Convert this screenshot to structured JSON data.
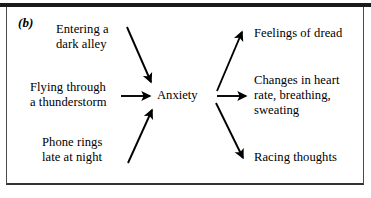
{
  "figure": {
    "panel_label": "(b)",
    "center_node": "Anxiety",
    "border_color": "#1a1a1a",
    "text_color": "#000000",
    "background_color": "#ffffff",
    "arrow_color": "#000000"
  },
  "stimuli": [
    {
      "id": "entering-dark-alley",
      "label": "Entering a\ndark alley"
    },
    {
      "id": "flying-thunderstorm",
      "label": "Flying through\na thunderstorm"
    },
    {
      "id": "phone-rings-late",
      "label": "Phone rings\nlate at night"
    }
  ],
  "responses": [
    {
      "id": "feelings-of-dread",
      "label": "Feelings of dread"
    },
    {
      "id": "physiological-changes",
      "label": "Changes in heart\nrate, breathing,\nsweating"
    },
    {
      "id": "racing-thoughts",
      "label": "Racing thoughts"
    }
  ],
  "arrows": [
    {
      "id": "arrow-stimulus-0-to-center",
      "from": "entering-dark-alley",
      "to": "Anxiety",
      "direction": "down-right",
      "x1": 127,
      "y1": 27,
      "x2": 152,
      "y2": 84
    },
    {
      "id": "arrow-stimulus-1-to-center",
      "from": "flying-thunderstorm",
      "to": "Anxiety",
      "direction": "right",
      "x1": 121,
      "y1": 96,
      "x2": 152,
      "y2": 96
    },
    {
      "id": "arrow-stimulus-2-to-center",
      "from": "phone-rings-late",
      "to": "Anxiety",
      "direction": "up-right",
      "x1": 128,
      "y1": 163,
      "x2": 152,
      "y2": 108
    },
    {
      "id": "arrow-center-to-response-0",
      "from": "Anxiety",
      "to": "feelings-of-dread",
      "direction": "up-right",
      "x1": 217,
      "y1": 91,
      "x2": 243,
      "y2": 30
    },
    {
      "id": "arrow-center-to-response-1",
      "from": "Anxiety",
      "to": "physiological-changes",
      "direction": "right",
      "x1": 217,
      "y1": 96,
      "x2": 248,
      "y2": 96
    },
    {
      "id": "arrow-center-to-response-2",
      "from": "Anxiety",
      "to": "racing-thoughts",
      "direction": "down-right",
      "x1": 216,
      "y1": 103,
      "x2": 245,
      "y2": 160
    }
  ]
}
